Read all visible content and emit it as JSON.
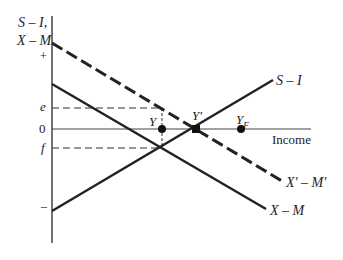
{
  "diagram": {
    "y_axis_label_line1": "S – I,",
    "y_axis_label_line2": "X – M",
    "ticks": {
      "plus": "+",
      "e": "e",
      "zero": "0",
      "f": "f",
      "minus": "–"
    },
    "x_axis_label": "Income",
    "curves": {
      "s_minus_i": "S – I",
      "xprime_minus_mprime": "X′ – M′",
      "x_minus_m": "X – M"
    },
    "points": {
      "y": "Y",
      "y_prime": "Y′",
      "y_f": "Y",
      "y_f_sub": "F"
    },
    "colors": {
      "line": "#222222",
      "axis": "#555555"
    }
  }
}
